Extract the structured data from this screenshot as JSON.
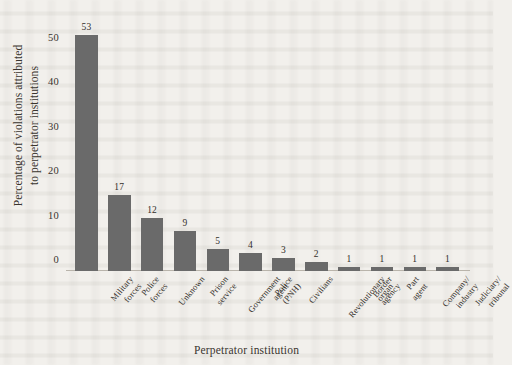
{
  "figure": {
    "background_color": "#f2f0ec",
    "bar_color": "#6a6a6a",
    "axis_color": "#b9b4ab",
    "text_color": "#332f2a"
  },
  "axis_titles": {
    "y_line1": "Percentage of violations attributed",
    "y_line2": "to perpetrator institutions",
    "x": "Perpetrator institution"
  },
  "y_ticks": [
    {
      "label": "0",
      "value": 0
    },
    {
      "label": "10",
      "value": 10
    },
    {
      "label": "20",
      "value": 20
    },
    {
      "label": "30",
      "value": 30
    },
    {
      "label": "40",
      "value": 40
    },
    {
      "label": "50",
      "value": 50
    }
  ],
  "chart_data": {
    "type": "bar",
    "title": "",
    "subtitle": "",
    "xlabel": "Perpetrator institution",
    "ylabel": "Percentage of violations attributed to perpetrator institutions",
    "ylim": [
      0,
      56
    ],
    "ytick_values": [
      0,
      10,
      20,
      30,
      40,
      50
    ],
    "ytick_labels": [
      "0",
      "10",
      "20",
      "30",
      "40",
      "50"
    ],
    "grid": false,
    "legend": false,
    "legend_position": "none",
    "orientation": "vertical",
    "bar_color": "#6a6a6a",
    "value_labels_shown": true,
    "categories": [
      "Military forces",
      "Police forces",
      "Unknown",
      "Prison service",
      "Government agent",
      "Police (PNH)",
      "Civilians",
      "Revolutionary organ",
      "Border agency",
      "Part agent",
      "Company/industry",
      "Judiciary/tribunal"
    ],
    "category_labels": [
      {
        "line1": "Military",
        "line2": "forces"
      },
      {
        "line1": "Police",
        "line2": "forces"
      },
      {
        "line1": "Unknown",
        "line2": ""
      },
      {
        "line1": "Prison",
        "line2": "service"
      },
      {
        "line1": "Government",
        "line2": "agent"
      },
      {
        "line1": "Police",
        "line2": "(PNH)"
      },
      {
        "line1": "Civilians",
        "line2": ""
      },
      {
        "line1": "Revolutionary",
        "line2": "organ"
      },
      {
        "line1": "Border",
        "line2": "agency"
      },
      {
        "line1": "Part",
        "line2": "agent"
      },
      {
        "line1": "Company/",
        "line2": "industry"
      },
      {
        "line1": "Judiciary/",
        "line2": "tribunal"
      }
    ],
    "values": [
      53,
      17,
      12,
      9,
      5,
      4,
      3,
      2,
      1,
      1,
      1,
      1
    ],
    "value_labels": [
      "53",
      "17",
      "12",
      "9",
      "5",
      "4",
      "3",
      "2",
      "1",
      "1",
      "1",
      "1"
    ]
  }
}
